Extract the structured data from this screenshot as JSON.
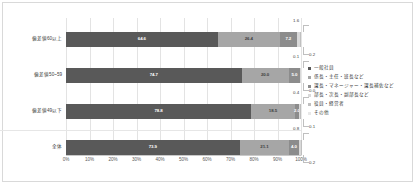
{
  "chart_data": {
    "type": "bar",
    "subtype": "horizontal-100-percent-stacked",
    "title": "",
    "xlabel": "",
    "ylabel": "",
    "xlim": [
      0,
      100
    ],
    "grid": true,
    "legend_position": "right",
    "categories": [
      "偏差値60以上",
      "偏差値50~59",
      "偏差値49以下",
      "全体"
    ],
    "xticks": [
      "0%",
      "10%",
      "20%",
      "30%",
      "40%",
      "50%",
      "60%",
      "70%",
      "80%",
      "90%",
      "100%"
    ],
    "xtick_values": [
      0,
      10,
      20,
      30,
      40,
      50,
      60,
      70,
      80,
      90,
      100
    ],
    "series": [
      {
        "name": "一般社員",
        "color": "#595959",
        "values": [
          64.6,
          74.7,
          78.8,
          73.9
        ]
      },
      {
        "name": "係長・主任・班長など",
        "color": "#a6a6a6",
        "values": [
          26.4,
          20.0,
          18.5,
          21.1
        ]
      },
      {
        "name": "課長・マネージャー・課長補佐など",
        "color": "#8c8c8c",
        "values": [
          7.2,
          5.0,
          2.0,
          4.0
        ]
      },
      {
        "name": "部長・次長・副部長など",
        "color": "#d9d9d9",
        "values": [
          1.6,
          0.1,
          0.4,
          0.8
        ]
      },
      {
        "name": "役員・経営者",
        "color": "#bfbfbf",
        "values": [
          0.2,
          0.1,
          0.1,
          0.2
        ]
      },
      {
        "name": "その他",
        "color": "#e8e8e8",
        "values": [
          0.0,
          0.1,
          0.2,
          0.0
        ]
      }
    ],
    "rows": [
      {
        "category": "偏差値60以上",
        "inbar": [
          {
            "label": "64.6",
            "value": 64.6
          },
          {
            "label": "26.4",
            "value": 26.4
          },
          {
            "label": "7.2",
            "value": 7.2
          }
        ],
        "callouts": [
          {
            "label": "1.6",
            "position": "above"
          },
          {
            "label": "0.2",
            "position": "below"
          }
        ]
      },
      {
        "category": "偏差値50~59",
        "inbar": [
          {
            "label": "74.7",
            "value": 74.7
          },
          {
            "label": "20.0",
            "value": 20.0
          },
          {
            "label": "5.0",
            "value": 5.0
          }
        ],
        "callouts": [
          {
            "label": "0.1",
            "position": "above"
          },
          {
            "label": "0.0",
            "position": "below"
          }
        ]
      },
      {
        "category": "偏差値49以下",
        "inbar": [
          {
            "label": "78.8",
            "value": 78.8
          },
          {
            "label": "18.5",
            "value": 18.5
          },
          {
            "label": "2.0",
            "value": 2.0
          }
        ],
        "callouts": [
          {
            "label": "0.4",
            "position": "above"
          },
          {
            "label": "0.1",
            "position": "below"
          }
        ]
      },
      {
        "category": "全体",
        "inbar": [
          {
            "label": "73.9",
            "value": 73.9
          },
          {
            "label": "21.1",
            "value": 21.1
          },
          {
            "label": "4.0",
            "value": 4.0
          }
        ],
        "callouts": [
          {
            "label": "0.8",
            "position": "above"
          },
          {
            "label": "0.2",
            "position": "below"
          }
        ]
      }
    ]
  },
  "legend": {
    "items": [
      {
        "label": "一般社員",
        "color": "#595959"
      },
      {
        "label": "係長・主任・班長など",
        "color": "#a6a6a6"
      },
      {
        "label": "課長・マネージャー・課長補佐など",
        "color": "#8c8c8c"
      },
      {
        "label": "部長・次長・副部長など",
        "color": "#d9d9d9"
      },
      {
        "label": "役員・経営者",
        "color": "#bfbfbf"
      },
      {
        "label": "その他",
        "color": "#e8e8e8"
      }
    ]
  }
}
